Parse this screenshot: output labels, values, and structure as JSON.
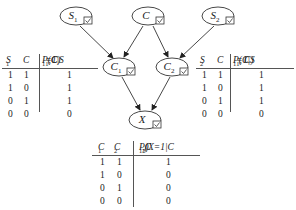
{
  "nodes": {
    "S1": {
      "label": "S",
      "sub": "1"
    },
    "C": {
      "label": "C",
      "sub": ""
    },
    "S2": {
      "label": "S",
      "sub": "2"
    },
    "C1": {
      "label": "C",
      "sub": "1"
    },
    "C2": {
      "label": "C",
      "sub": "2"
    },
    "X": {
      "label": "X",
      "sub": ""
    }
  },
  "edges": [
    {
      "from": "S1",
      "to": "C1"
    },
    {
      "from": "C",
      "to": "C1"
    },
    {
      "from": "C",
      "to": "C2"
    },
    {
      "from": "S2",
      "to": "C2"
    },
    {
      "from": "C1",
      "to": "X"
    },
    {
      "from": "C2",
      "to": "X"
    }
  ],
  "tables": {
    "c1": {
      "col1": {
        "label": "S",
        "sub": "1"
      },
      "col2": {
        "label": "C",
        "sub": ""
      },
      "col3": {
        "pre": "P(C",
        "sub1": "1",
        "mid": "=1|S",
        "sub2": "1",
        "post": ",C)"
      },
      "rows": [
        [
          "1",
          "1",
          "1"
        ],
        [
          "1",
          "0",
          "1"
        ],
        [
          "0",
          "1",
          "1"
        ],
        [
          "0",
          "0",
          "0"
        ]
      ]
    },
    "c2": {
      "col1": {
        "label": "S",
        "sub": "2"
      },
      "col2": {
        "label": "C",
        "sub": ""
      },
      "col3": {
        "pre": "P(C",
        "sub1": "1",
        "mid": "=1|S",
        "sub2": "1",
        "post": ", C)"
      },
      "rows": [
        [
          "1",
          "1",
          "1"
        ],
        [
          "1",
          "0",
          "1"
        ],
        [
          "0",
          "1",
          "1"
        ],
        [
          "0",
          "0",
          "0"
        ]
      ]
    },
    "x": {
      "col1": {
        "label": "C",
        "sub": "1"
      },
      "col2": {
        "label": "C",
        "sub": "2"
      },
      "col3": {
        "pre": "P(X=1|C",
        "sub1": "1",
        "mid": ",C",
        "sub2": "2",
        "post": ")"
      },
      "rows": [
        [
          "1",
          "1",
          "1"
        ],
        [
          "1",
          "0",
          "0"
        ],
        [
          "0",
          "1",
          "0"
        ],
        [
          "0",
          "0",
          "0"
        ]
      ]
    }
  }
}
